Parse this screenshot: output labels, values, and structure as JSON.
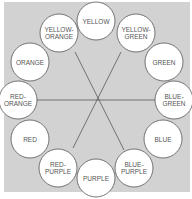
{
  "diagram": {
    "colors": {
      "panel": "#d2d2d2",
      "circle_fill": "#ffffff",
      "line": "#555555"
    },
    "segments": [
      {
        "label": "YELLOW",
        "cx": 96,
        "cy": 21
      },
      {
        "label": "YELLOW-\nGREEN",
        "cx": 136,
        "cy": 33
      },
      {
        "label": "GREEN",
        "cx": 164,
        "cy": 62
      },
      {
        "label": "BLUE-\nGREEN",
        "cx": 174,
        "cy": 100
      },
      {
        "label": "BLUE",
        "cx": 163,
        "cy": 139
      },
      {
        "label": "BLUE-\nPURPLE",
        "cx": 134,
        "cy": 168
      },
      {
        "label": "PURPLE",
        "cx": 96,
        "cy": 178
      },
      {
        "label": "RED-\nPURPLE",
        "cx": 58,
        "cy": 168
      },
      {
        "label": "RED",
        "cx": 30,
        "cy": 139
      },
      {
        "label": "RED-\nORANGE",
        "cx": 18,
        "cy": 100
      },
      {
        "label": "ORANGE",
        "cx": 30,
        "cy": 62
      },
      {
        "label": "YELLOW-\nORANGE",
        "cx": 59,
        "cy": 33
      }
    ],
    "lines": [
      {
        "from": "YELLOW-ORANGE",
        "to": "BLUE-PURPLE"
      },
      {
        "from": "YELLOW-GREEN",
        "to": "RED-PURPLE"
      },
      {
        "from": "RED-ORANGE",
        "to": "BLUE-GREEN"
      }
    ]
  }
}
